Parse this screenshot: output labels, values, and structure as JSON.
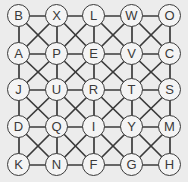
{
  "puzzle": {
    "type": "letter-grid",
    "rows": 5,
    "cols": 5,
    "grid": [
      [
        "B",
        "X",
        "L",
        "W",
        "O"
      ],
      [
        "A",
        "P",
        "E",
        "V",
        "C"
      ],
      [
        "J",
        "U",
        "R",
        "T",
        "S"
      ],
      [
        "D",
        "Q",
        "I",
        "Y",
        "M"
      ],
      [
        "K",
        "N",
        "F",
        "G",
        "H"
      ]
    ],
    "connections": "orthogonal-and-diagonal"
  },
  "colors": {
    "background": "#ececec",
    "line": "#3a3a3a",
    "node_fill": "#f4f4f4",
    "text": "#3a3a3a"
  }
}
